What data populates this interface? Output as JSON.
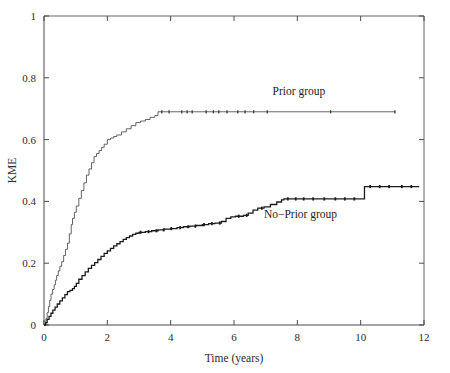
{
  "chart_data": {
    "type": "line",
    "title": "",
    "xlabel": "Time (years)",
    "ylabel": "KME",
    "xlim": [
      0,
      12
    ],
    "ylim": [
      0,
      1
    ],
    "grid": false,
    "legend_position": "inline-annotation",
    "xticks": [
      0,
      2,
      4,
      6,
      8,
      10,
      12
    ],
    "xtick_labels": [
      "0",
      "2",
      "4",
      "6",
      "8",
      "10",
      "12"
    ],
    "yticks": [
      0,
      0.2,
      0.4,
      0.6,
      0.8,
      1
    ],
    "ytick_labels": [
      "0",
      "0.2",
      "0.4",
      "0.6",
      "0.8",
      "1"
    ],
    "series": [
      {
        "name": "Prior group",
        "label": "Prior group",
        "color": "#3d3d3d",
        "line_width": 0.8,
        "step": "post",
        "label_x": 8.05,
        "label_y": 0.745,
        "x": [
          0,
          0.06,
          0.1,
          0.14,
          0.18,
          0.22,
          0.27,
          0.32,
          0.36,
          0.4,
          0.45,
          0.5,
          0.56,
          0.62,
          0.68,
          0.74,
          0.8,
          0.86,
          0.9,
          0.96,
          1.02,
          1.1,
          1.18,
          1.26,
          1.34,
          1.42,
          1.5,
          1.58,
          1.66,
          1.74,
          1.82,
          1.9,
          2.0,
          2.1,
          2.2,
          2.3,
          2.45,
          2.6,
          2.75,
          2.9,
          3.05,
          3.2,
          3.35,
          3.5,
          3.6,
          11.1
        ],
        "y": [
          0,
          0.02,
          0.04,
          0.06,
          0.08,
          0.1,
          0.115,
          0.13,
          0.145,
          0.16,
          0.175,
          0.19,
          0.205,
          0.225,
          0.245,
          0.265,
          0.295,
          0.325,
          0.345,
          0.365,
          0.385,
          0.41,
          0.435,
          0.46,
          0.485,
          0.505,
          0.525,
          0.545,
          0.555,
          0.565,
          0.575,
          0.585,
          0.6,
          0.605,
          0.61,
          0.615,
          0.625,
          0.635,
          0.645,
          0.655,
          0.66,
          0.665,
          0.672,
          0.678,
          0.69,
          0.69
        ],
        "censor_times": [
          3.72,
          3.95,
          4.35,
          4.52,
          4.68,
          5.12,
          5.35,
          5.52,
          5.78,
          6.12,
          6.35,
          6.62,
          7.05,
          9.05,
          11.08
        ],
        "censor_value": 0.69,
        "plateau_value": 0.69,
        "plateau_start": 3.6,
        "end_x": 11.1
      },
      {
        "name": "No-Prior group",
        "label": "No−Prior group",
        "color": "#1c1c1c",
        "line_width": 1.3,
        "step": "post",
        "label_x": 8.1,
        "label_y": 0.345,
        "x": [
          0,
          0.05,
          0.1,
          0.16,
          0.22,
          0.28,
          0.35,
          0.42,
          0.5,
          0.58,
          0.66,
          0.74,
          0.82,
          0.9,
          0.96,
          1.02,
          1.1,
          1.2,
          1.3,
          1.4,
          1.5,
          1.6,
          1.7,
          1.8,
          1.9,
          2.0,
          2.1,
          2.2,
          2.3,
          2.4,
          2.5,
          2.6,
          2.7,
          2.8,
          2.9,
          3.0,
          3.2,
          3.4,
          3.6,
          3.8,
          4.0,
          4.2,
          4.4,
          4.6,
          4.8,
          5.0,
          5.2,
          5.4,
          5.6,
          5.75,
          5.9,
          6.05,
          6.3,
          6.45,
          6.6,
          6.75,
          6.95,
          7.15,
          7.35,
          7.5,
          7.58,
          10.05,
          10.12,
          11.85
        ],
        "y": [
          0,
          0.008,
          0.018,
          0.028,
          0.038,
          0.048,
          0.058,
          0.068,
          0.078,
          0.088,
          0.098,
          0.108,
          0.112,
          0.118,
          0.125,
          0.135,
          0.148,
          0.16,
          0.172,
          0.183,
          0.193,
          0.202,
          0.212,
          0.222,
          0.232,
          0.24,
          0.248,
          0.256,
          0.263,
          0.27,
          0.277,
          0.283,
          0.288,
          0.293,
          0.297,
          0.3,
          0.302,
          0.305,
          0.308,
          0.31,
          0.312,
          0.315,
          0.318,
          0.32,
          0.322,
          0.325,
          0.328,
          0.33,
          0.335,
          0.345,
          0.35,
          0.352,
          0.355,
          0.362,
          0.372,
          0.378,
          0.382,
          0.39,
          0.398,
          0.405,
          0.408,
          0.408,
          0.448,
          0.448
        ],
        "censor_times": [
          3.05,
          3.3,
          3.55,
          3.78,
          4.02,
          4.3,
          4.55,
          4.78,
          5.05,
          5.3,
          5.55,
          6.15,
          6.4,
          6.88,
          7.7,
          7.95,
          8.2,
          8.5,
          8.85,
          9.2,
          9.5,
          9.8,
          10.3,
          10.6,
          10.9,
          11.3,
          11.6
        ],
        "end_x": 11.85
      }
    ]
  },
  "figure": {
    "background": "#ffffff",
    "axis_color": "#4a4a4a",
    "text_color": "#2b2b2b"
  }
}
